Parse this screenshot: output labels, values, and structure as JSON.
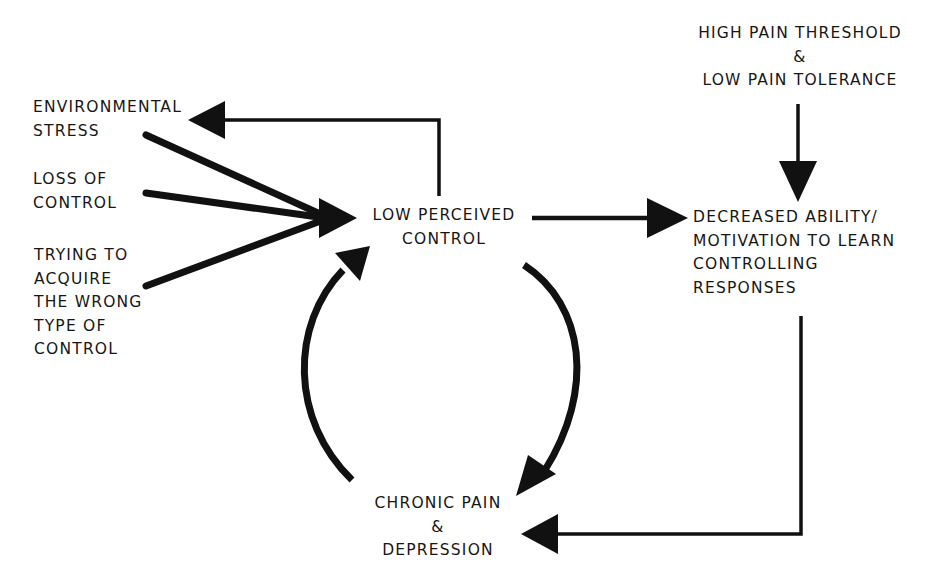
{
  "diagram": {
    "type": "flow-cycle",
    "nodes": {
      "environmental_stress": {
        "lines": [
          "ENVIRONMENTAL",
          "STRESS"
        ]
      },
      "loss_of_control": {
        "lines": [
          "LOSS OF",
          "CONTROL"
        ]
      },
      "wrong_control": {
        "lines": [
          "TRYING TO",
          "ACQUIRE",
          "THE WRONG",
          "TYPE OF",
          "CONTROL"
        ]
      },
      "low_perceived_control": {
        "lines": [
          "LOW PERCEIVED",
          "CONTROL"
        ]
      },
      "pain_threshold": {
        "lines": [
          "HIGH PAIN THRESHOLD",
          "&",
          "LOW PAIN TOLERANCE"
        ]
      },
      "decreased_ability": {
        "lines": [
          "DECREASED ABILITY/",
          "MOTIVATION TO LEARN",
          "CONTROLLING",
          "RESPONSES"
        ]
      },
      "chronic_pain": {
        "lines": [
          "CHRONIC PAIN",
          "&",
          "DEPRESSION"
        ]
      }
    },
    "edges": [
      {
        "from": "environmental_stress",
        "to": "low_perceived_control"
      },
      {
        "from": "loss_of_control",
        "to": "low_perceived_control"
      },
      {
        "from": "wrong_control",
        "to": "low_perceived_control"
      },
      {
        "from": "low_perceived_control",
        "to": "environmental_stress"
      },
      {
        "from": "low_perceived_control",
        "to": "decreased_ability"
      },
      {
        "from": "pain_threshold",
        "to": "decreased_ability"
      },
      {
        "from": "decreased_ability",
        "to": "chronic_pain"
      },
      {
        "from": "low_perceived_control",
        "to": "chronic_pain"
      },
      {
        "from": "chronic_pain",
        "to": "low_perceived_control"
      }
    ],
    "colors": {
      "ink": "#111111",
      "background": "#ffffff"
    }
  }
}
